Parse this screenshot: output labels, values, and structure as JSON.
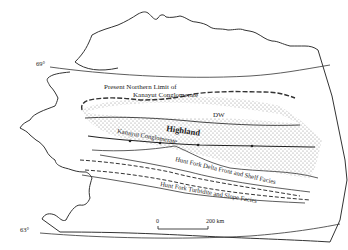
{
  "map": {
    "latitude_labels": {
      "north": "69°",
      "south": "63°"
    },
    "region_code": "DW",
    "labels": {
      "northern_limit_line1": "Present Northern Limit of",
      "northern_limit_line2": "Kanayut Conglomerate",
      "highland": "Highland",
      "kanayut": "Kanayut Conglomerate",
      "hunt_fork_delta": "Hunt Fork Delta Front and Shelf Facies",
      "hunt_fork_turbidite": "Hunt Fork Turbidite and Slope Facies"
    },
    "scale_bar": {
      "start": "0",
      "end": "200 km"
    },
    "colors": {
      "line": "#333333",
      "stipple": "#9a9a9a",
      "background": "#ffffff"
    }
  }
}
